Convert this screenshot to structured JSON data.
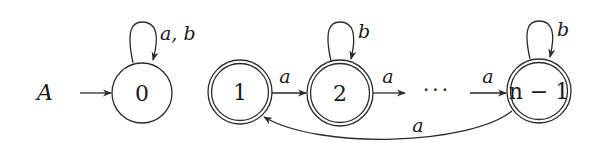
{
  "automaton": {
    "name": "A",
    "colors": {
      "stroke": "#2a2a2a",
      "text": "#1a1a1a",
      "background": "#ffffff"
    },
    "states": [
      {
        "id": "q0",
        "label": "0",
        "initial": true,
        "accepting": false
      },
      {
        "id": "q1",
        "label": "1",
        "initial": false,
        "accepting": true
      },
      {
        "id": "q2",
        "label": "2",
        "initial": false,
        "accepting": true
      },
      {
        "id": "qn1",
        "label": "n − 1",
        "initial": false,
        "accepting": true
      }
    ],
    "ellipsis": "···",
    "transitions": [
      {
        "from": "q0",
        "to": "q0",
        "label": "a, b"
      },
      {
        "from": "q1",
        "to": "q2",
        "label": "a"
      },
      {
        "from": "q2",
        "to": "q2",
        "label": "b"
      },
      {
        "from": "q2",
        "to": "…",
        "label": "a"
      },
      {
        "from": "…",
        "to": "qn1",
        "label": "a"
      },
      {
        "from": "qn1",
        "to": "qn1",
        "label": "b"
      },
      {
        "from": "qn1",
        "to": "q1",
        "label": "a"
      }
    ]
  }
}
